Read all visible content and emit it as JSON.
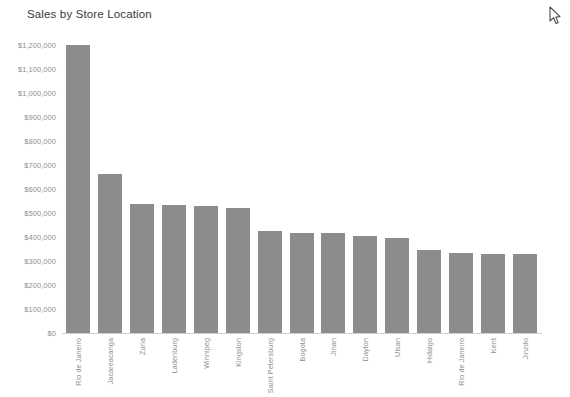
{
  "chart_data": {
    "type": "bar",
    "title": "Sales by Store Location",
    "xlabel": "",
    "ylabel": "",
    "ylim": [
      0,
      1200000
    ],
    "ytick_step": 100000,
    "grid": false,
    "legend": "none",
    "orientation": "vertical",
    "bar_color": "#8c8c8c",
    "categories": [
      "Rio de Janeiro",
      "Jacareacanga",
      "Zuria",
      "Ladenburg",
      "Winnipeg",
      "Kingston",
      "Saint Petersburg",
      "Bogota",
      "Jinan",
      "Dayton",
      "Ulsan",
      "Hidalgo",
      "Rio de Janeiro",
      "Kent",
      "Jinzdo"
    ],
    "values": [
      1200000,
      663000,
      537000,
      535000,
      531000,
      521000,
      424000,
      417000,
      415000,
      404000,
      395000,
      347000,
      333000,
      331000,
      328000
    ],
    "ytick_labels": [
      "$1,200,000",
      "$1,100,000",
      "$1,000,000",
      "$900,000",
      "$800,000",
      "$700,000",
      "$600,000",
      "$500,000",
      "$400,000",
      "$300,000",
      "$200,000",
      "$100,000",
      "$0"
    ],
    "ytick_values": [
      1200000,
      1100000,
      1000000,
      900000,
      800000,
      700000,
      600000,
      500000,
      400000,
      300000,
      200000,
      100000,
      0
    ]
  },
  "cursor": {
    "icon": "mouse-pointer-icon"
  }
}
